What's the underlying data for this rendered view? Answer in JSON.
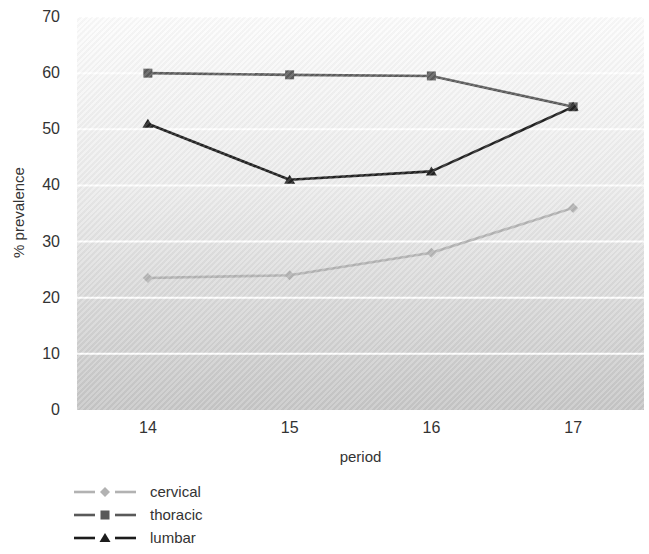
{
  "chart_data": {
    "type": "line",
    "title": "",
    "xlabel": "period",
    "ylabel": "% prevalence",
    "categories": [
      "14",
      "15",
      "16",
      "17"
    ],
    "yticks": [
      0,
      10,
      20,
      30,
      40,
      50,
      60,
      70
    ],
    "ylim": [
      0,
      70
    ],
    "grid": true,
    "gridline_color": "#ffffff",
    "legend_position": "bottom-left",
    "series": [
      {
        "name": "cervical",
        "values": [
          23.5,
          24,
          28,
          36
        ],
        "color": "#b2b2b2",
        "marker": "diamond"
      },
      {
        "name": "thoracic",
        "values": [
          60,
          59.7,
          59.5,
          54
        ],
        "color": "#595959",
        "marker": "square"
      },
      {
        "name": "lumbar",
        "values": [
          51,
          41,
          42.5,
          54
        ],
        "color": "#1c1c1c",
        "marker": "triangle"
      }
    ]
  },
  "colors": {
    "plot_background_top": "#fcfcfc",
    "plot_background_bottom": "#c6c6c6",
    "text": "#333333",
    "page_background": "#ffffff"
  }
}
